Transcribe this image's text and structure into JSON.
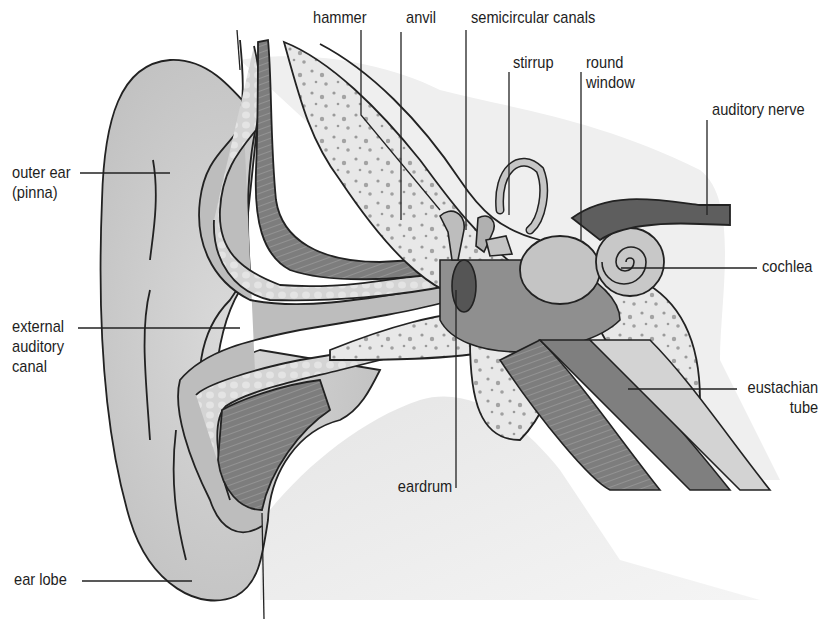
{
  "diagram": {
    "background_color": "#ffffff",
    "line_color": "#222222",
    "colors": {
      "skin": "#c9c9c9",
      "skin_light": "#dcdcdc",
      "cartilage": "#b4b4b4",
      "bone": "#e6e6e6",
      "bone_speckle": "#9a9a9a",
      "muscle": "#8a8a8a",
      "dark_tissue": "#5c5c5c",
      "nerve": "#666666"
    },
    "labels": [
      {
        "id": "hammer",
        "lines": [
          "hammer"
        ]
      },
      {
        "id": "anvil",
        "lines": [
          "anvil"
        ]
      },
      {
        "id": "semicircular-canals",
        "lines": [
          "semicircular canals"
        ]
      },
      {
        "id": "stirrup",
        "lines": [
          "stirrup"
        ]
      },
      {
        "id": "round-window",
        "lines": [
          "round",
          "window"
        ]
      },
      {
        "id": "auditory-nerve",
        "lines": [
          "auditory nerve"
        ]
      },
      {
        "id": "outer-ear",
        "lines": [
          "outer ear",
          "(pinna)"
        ]
      },
      {
        "id": "cochlea",
        "lines": [
          "cochlea"
        ]
      },
      {
        "id": "external-auditory-canal",
        "lines": [
          "external",
          "auditory",
          "canal"
        ]
      },
      {
        "id": "eustachian-tube",
        "lines": [
          "eustachian",
          "tube"
        ]
      },
      {
        "id": "eardrum",
        "lines": [
          "eardrum"
        ]
      },
      {
        "id": "ear-lobe",
        "lines": [
          "ear lobe"
        ]
      }
    ]
  }
}
